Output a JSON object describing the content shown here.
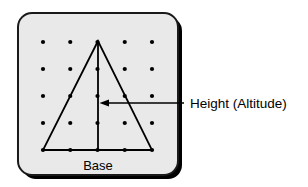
{
  "figure": {
    "title_label": "Height (Altitude)",
    "base_label": "Base",
    "callout_label": "Height (Altitude)",
    "colors": {
      "page_background": "#ffffff",
      "board_fill": "#e9e9e9",
      "board_stroke": "#1a1a1a",
      "board_shadow": "#000000",
      "dot_color": "#000000",
      "line_color": "#000000",
      "text_color": "#000000"
    },
    "board": {
      "x": 18,
      "y": 13,
      "width": 160,
      "height": 162,
      "corner_radius": 14,
      "shadow_offset": 4
    },
    "geoboard": {
      "rows": 5,
      "cols": 5,
      "origin_x": 43,
      "origin_y": 42,
      "spacing_x": 27.25,
      "spacing_y": 27,
      "dot_radius": 2.1
    },
    "triangle": {
      "apex": {
        "x": 98,
        "y": 41
      },
      "bottom_left": {
        "x": 43,
        "y": 150
      },
      "bottom_right": {
        "x": 152,
        "y": 150
      },
      "stroke_width": 1.8
    },
    "altitude": {
      "from": {
        "x": 98,
        "y": 41
      },
      "to": {
        "x": 98,
        "y": 150
      },
      "stroke_width": 1.8
    },
    "arrow": {
      "tail_x": 184,
      "tip_x": 100,
      "y": 103,
      "head_length": 9,
      "head_width": 4.5,
      "stroke_width": 1.4
    },
    "base_text_position": {
      "x": 98,
      "y": 170,
      "font_size": 13
    },
    "callout_text_position": {
      "x": 190,
      "y": 108,
      "font_size": 13.5
    }
  }
}
